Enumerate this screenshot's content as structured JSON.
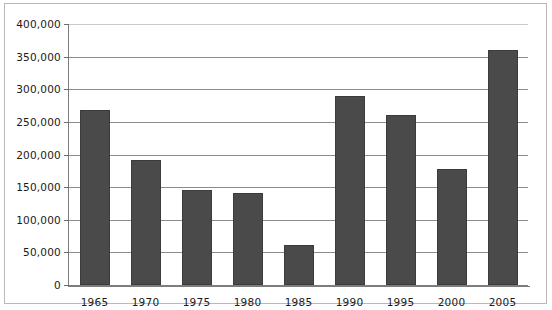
{
  "chart_data": {
    "type": "bar",
    "title": "",
    "subtitle": "",
    "xlabel": "",
    "ylabel": "",
    "categories": [
      "1965",
      "1970",
      "1975",
      "1980",
      "1985",
      "1990",
      "1995",
      "2000",
      "2005"
    ],
    "values": [
      268000,
      191000,
      146000,
      141000,
      62000,
      290000,
      261000,
      178000,
      360000
    ],
    "ylim": [
      0,
      400000
    ],
    "ytick_values": [
      0,
      50000,
      100000,
      150000,
      200000,
      250000,
      300000,
      350000,
      400000
    ],
    "ytick_labels": [
      "0",
      "50,000",
      "100,000",
      "150,000",
      "200,000",
      "250,000",
      "300,000",
      "350,000",
      "400,000"
    ],
    "grid": true,
    "legend": false,
    "legend_position": "none",
    "bar_color": "#4a4a4a",
    "grid_color": "#8c8c8c",
    "axis_color": "#7d7d7d",
    "frame_color": "#b9b9b9",
    "background_color": "#ffffff"
  }
}
